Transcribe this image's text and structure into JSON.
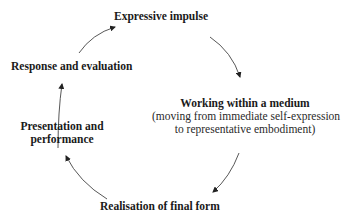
{
  "diagram": {
    "type": "cycle",
    "nodes": [
      {
        "id": "expressive",
        "label": "Expressive impulse"
      },
      {
        "id": "working",
        "label": "Working within a medium",
        "sublabel_line1": "(moving from immediate self-expression",
        "sublabel_line2": "to representative embodiment)"
      },
      {
        "id": "realisation",
        "label": "Realisation of final form"
      },
      {
        "id": "presentation",
        "label_line1": "Presentation and",
        "label_line2": "performance"
      },
      {
        "id": "response",
        "label": "Response and evaluation"
      }
    ],
    "edges": [
      {
        "from": "expressive",
        "to": "working"
      },
      {
        "from": "working",
        "to": "realisation"
      },
      {
        "from": "realisation",
        "to": "presentation"
      },
      {
        "from": "presentation",
        "to": "response"
      },
      {
        "from": "response",
        "to": "expressive"
      }
    ],
    "colors": {
      "text": "#1a1a1a",
      "arrow": "#333333",
      "background": "#ffffff"
    }
  }
}
